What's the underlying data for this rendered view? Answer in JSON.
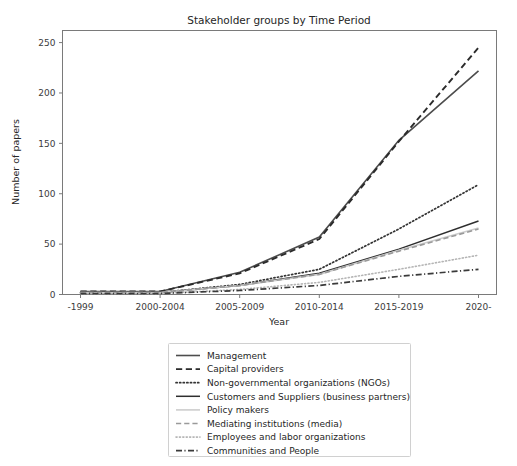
{
  "chart_data": {
    "type": "line",
    "title": "Stakeholder groups by Time Period",
    "xlabel": "Year",
    "ylabel": "Number of papers",
    "categories": [
      "-1999",
      "2000-2004",
      "2005-2009",
      "2010-2014",
      "2015-2019",
      "2020-"
    ],
    "ylim": [
      0,
      262
    ],
    "yticks": [
      "0",
      "50",
      "100",
      "150",
      "200",
      "250"
    ],
    "ytick_values": [
      0,
      50,
      100,
      150,
      200,
      250
    ],
    "grid": false,
    "legend_position": "below-center",
    "series": [
      {
        "name": "Management",
        "values": [
          3,
          3,
          22,
          57,
          153,
          222
        ],
        "style": "solid",
        "color": "#4d4d4d",
        "width": 1.6
      },
      {
        "name": "Capital providers",
        "values": [
          3,
          3,
          21,
          55,
          152,
          245
        ],
        "style": "dashed",
        "color": "#2b2b2b",
        "width": 1.9
      },
      {
        "name": "Non-governmental organizations (NGOs)",
        "values": [
          2,
          2,
          10,
          25,
          65,
          109
        ],
        "style": "dotted",
        "color": "#333333",
        "width": 1.7
      },
      {
        "name": "Customers and Suppliers (business partners)",
        "values": [
          2,
          2,
          9,
          21,
          45,
          73
        ],
        "style": "solid",
        "color": "#2e2e2e",
        "width": 1.5
      },
      {
        "name": "Policy makers",
        "values": [
          2,
          2,
          9,
          20,
          44,
          66
        ],
        "style": "solid",
        "color": "#cdcdcd",
        "width": 1.6
      },
      {
        "name": "Mediating institutions (media)",
        "values": [
          2,
          2,
          9,
          20,
          43,
          65
        ],
        "style": "dashed",
        "color": "#9a9a9a",
        "width": 1.6
      },
      {
        "name": "Employees and labor organizations",
        "values": [
          1,
          1,
          5,
          12,
          25,
          39
        ],
        "style": "dotted",
        "color": "#b5b5b5",
        "width": 1.6
      },
      {
        "name": "Communities and People",
        "values": [
          1,
          1,
          4,
          9,
          18,
          25
        ],
        "style": "dashdot",
        "color": "#3a3a3a",
        "width": 1.7
      }
    ]
  },
  "colors": {
    "background": "#ffffff",
    "axis": "#7a7a7a",
    "text": "#262626",
    "legend_border": "#d0d0d0"
  }
}
